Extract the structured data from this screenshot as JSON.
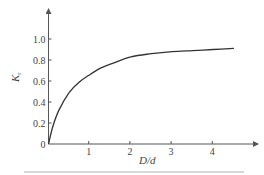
{
  "chart_data": {
    "type": "line",
    "title": "",
    "xlabel": "D/d",
    "ylabel": "K_r",
    "ylabel_main": "K",
    "ylabel_sub": "r",
    "xlim": [
      0,
      5
    ],
    "ylim": [
      0,
      1.2
    ],
    "grid": false,
    "legend": null,
    "x_ticks": [
      "1",
      "2",
      "3",
      "4"
    ],
    "y_ticks": [
      "0",
      "0.2",
      "0.4",
      "0.6",
      "0.8",
      "1.0"
    ],
    "series": [
      {
        "name": "K_r vs D/d",
        "x": [
          0,
          0.1,
          0.25,
          0.5,
          0.75,
          1.0,
          1.25,
          1.5,
          2.0,
          2.5,
          3.0,
          3.5,
          4.0,
          4.5
        ],
        "y": [
          0,
          0.16,
          0.32,
          0.49,
          0.59,
          0.66,
          0.72,
          0.76,
          0.83,
          0.86,
          0.88,
          0.89,
          0.9,
          0.91
        ]
      }
    ]
  },
  "axes": {
    "origin_label": "0",
    "x_label": "D/d",
    "y_label_main": "K",
    "y_label_sub": "r"
  },
  "style": {
    "axis_color": "#555555",
    "curve_color": "#333333"
  }
}
